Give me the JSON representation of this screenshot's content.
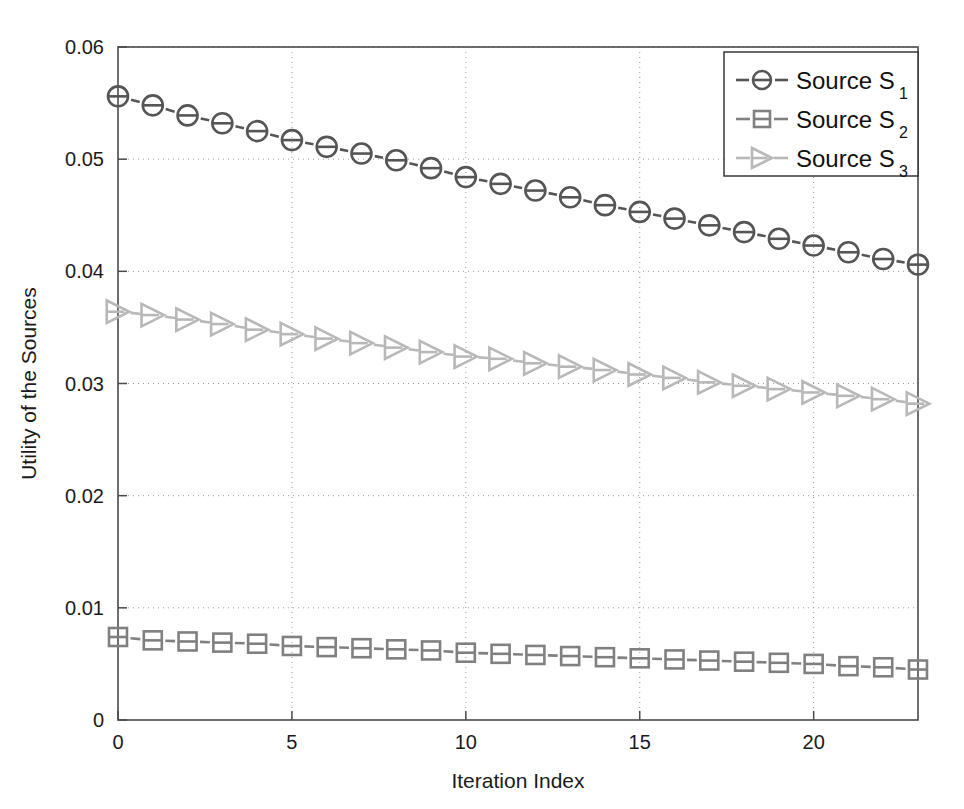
{
  "chart_data": {
    "type": "line",
    "title": "",
    "xlabel": "Iteration Index",
    "ylabel": "Utility of the Sources",
    "xlim": [
      0,
      23
    ],
    "ylim": [
      0,
      0.06
    ],
    "grid": true,
    "legend_position": "top-right",
    "x_ticks": [
      0,
      5,
      10,
      15,
      20
    ],
    "x_tick_labels": [
      "0",
      "5",
      "10",
      "15",
      "20"
    ],
    "y_ticks": [
      0,
      0.01,
      0.02,
      0.03,
      0.04,
      0.05,
      0.06
    ],
    "y_tick_labels": [
      "0",
      "0.01",
      "0.02",
      "0.03",
      "0.04",
      "0.05",
      "0.06"
    ],
    "x": [
      0,
      1,
      2,
      3,
      4,
      5,
      6,
      7,
      8,
      9,
      10,
      11,
      12,
      13,
      14,
      15,
      16,
      17,
      18,
      19,
      20,
      21,
      22,
      23
    ],
    "series": [
      {
        "name": "Source S",
        "subscript": "1",
        "legend_label": "Source S₁",
        "marker": "circle",
        "linestyle": "dashed",
        "color": "#555555",
        "values": [
          0.0556,
          0.0548,
          0.0539,
          0.0532,
          0.0525,
          0.0517,
          0.0511,
          0.0505,
          0.0499,
          0.0492,
          0.0484,
          0.0478,
          0.0472,
          0.0466,
          0.0459,
          0.0453,
          0.0447,
          0.0441,
          0.0435,
          0.0429,
          0.0423,
          0.0417,
          0.0411,
          0.0406
        ]
      },
      {
        "name": "Source S",
        "subscript": "2",
        "legend_label": "Source S₂",
        "marker": "square",
        "linestyle": "dashed",
        "color": "#808080",
        "values": [
          0.0074,
          0.0071,
          0.007,
          0.0069,
          0.0068,
          0.0066,
          0.0065,
          0.0064,
          0.0063,
          0.0062,
          0.006,
          0.0059,
          0.0058,
          0.0057,
          0.0056,
          0.0055,
          0.0054,
          0.0053,
          0.0052,
          0.0051,
          0.005,
          0.0048,
          0.0047,
          0.0045
        ]
      },
      {
        "name": "Source S",
        "subscript": "3",
        "legend_label": "Source S₃",
        "marker": "triangle-right",
        "linestyle": "dashed",
        "color": "#b8b8b8",
        "values": [
          0.0364,
          0.0361,
          0.0357,
          0.0353,
          0.0348,
          0.0344,
          0.034,
          0.0336,
          0.0332,
          0.0328,
          0.0324,
          0.0322,
          0.0318,
          0.0315,
          0.0312,
          0.0308,
          0.0305,
          0.0301,
          0.0298,
          0.0295,
          0.0292,
          0.0289,
          0.0286,
          0.0282
        ]
      }
    ]
  },
  "legend": {
    "entries": [
      {
        "label": "Source S",
        "subscript": "1"
      },
      {
        "label": "Source S",
        "subscript": "2"
      },
      {
        "label": "Source S",
        "subscript": "3"
      }
    ]
  },
  "axes": {
    "x_title": "Iteration Index",
    "y_title": "Utility of the Sources"
  },
  "colors": {
    "series_1": "#555555",
    "series_2": "#808080",
    "series_3": "#b8b8b8",
    "axis": "#4a4a4a",
    "grid": "#9a9a9a",
    "text": "#1a1a1a",
    "background": "#ffffff"
  }
}
